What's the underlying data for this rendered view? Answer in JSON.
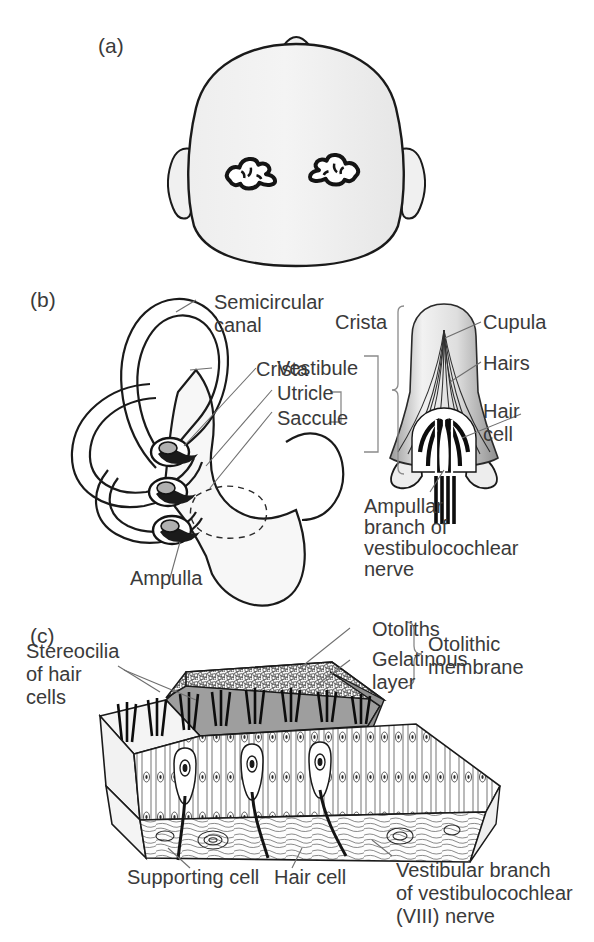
{
  "figure": {
    "background": "#ffffff",
    "text_color": "#3a3a3a",
    "line_color": "#6e6e6e"
  },
  "panels": [
    {
      "tag": "(a)",
      "name": "head-with-inner-ears",
      "description": "Superior view of head showing position of the two inner ear labyrinths",
      "labels": []
    },
    {
      "tag": "(b)",
      "name": "membranous-labyrinth-and-crista",
      "description": "Membranous labyrinth with semicircular canals and enlargement of a crista ampullaris",
      "labels": [
        "Semicircular canal",
        "Crista",
        "Ampulla",
        "Crista",
        "Vestibule",
        "Utricle",
        "Saccule",
        "Cupula",
        "Hairs",
        "Hair cell",
        "Ampullar branch of vestibulocochlear nerve"
      ]
    },
    {
      "tag": "(c)",
      "name": "macula-otolithic-membrane",
      "description": "Cutaway block of a macula showing otolithic membrane, hair cells and supporting cells",
      "labels": [
        "Stereocilia of hair cells",
        "Otoliths",
        "Gelatinous layer",
        "Otolithic membrane",
        "Supporting cell",
        "Hair cell",
        "Vestibular branch of vestibulocochlear (VIII) nerve"
      ]
    }
  ],
  "panel_a": {
    "tag": "(a)"
  },
  "panel_b": {
    "tag": "(b)",
    "semicircular_canal_l1": "Semicircular",
    "semicircular_canal_l2": "canal",
    "crista_left": "Crista",
    "ampulla": "Ampulla",
    "crista_bracket": "Crista",
    "vestibule": "Vestibule",
    "utricle": "Utricle",
    "saccule": "Saccule",
    "cupula": "Cupula",
    "hairs": "Hairs",
    "hair_cell_l1": "Hair",
    "hair_cell_l2": "cell",
    "nerve_l1": "Ampullar",
    "nerve_l2": "branch of",
    "nerve_l3": "vestibulocochlear",
    "nerve_l4": "nerve"
  },
  "panel_c": {
    "tag": "(c)",
    "stereocilia_l1": "Stereocilia",
    "stereocilia_l2": "of hair",
    "stereocilia_l3": "cells",
    "otoliths": "Otoliths",
    "gelatinous_l1": "Gelatinous",
    "gelatinous_l2": "layer",
    "otolithic_l1": "Otolithic",
    "otolithic_l2": "membrane",
    "supporting_cell": "Supporting cell",
    "hair_cell": "Hair cell",
    "vestibular_l1": "Vestibular branch",
    "vestibular_l2": "of vestibulocochlear",
    "vestibular_l3": "(VIII) nerve"
  }
}
